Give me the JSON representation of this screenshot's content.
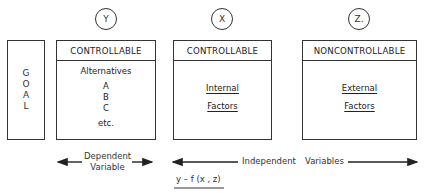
{
  "diagram": {
    "goal_box": {
      "letters": [
        "G",
        "O",
        "A",
        "L"
      ]
    },
    "columns": [
      {
        "circle_label": "Y",
        "header": "CONTROLLABLE",
        "body_title": "Alternatives",
        "items": [
          "A",
          "B",
          "C"
        ],
        "footer": "etc."
      },
      {
        "circle_label": "X",
        "header": "CONTROLLABLE",
        "body_lines": [
          "Internal",
          "Factors"
        ]
      },
      {
        "circle_label": "Z.",
        "header": "NONCONTROLLABLE",
        "body_lines": [
          "External",
          "Factors"
        ]
      }
    ],
    "dependent_arrow": {
      "line1": "Dependent",
      "line2": "Variable"
    },
    "independent_arrow": {
      "left": "Independent",
      "right": "Variables"
    },
    "formula": "y – f (x , z)"
  }
}
